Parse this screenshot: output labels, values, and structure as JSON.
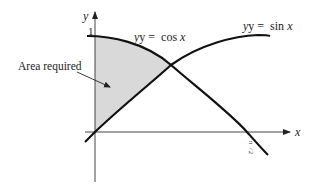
{
  "diagram": {
    "type": "area-between-curves",
    "axes": {
      "x_label": "x",
      "y_label": "y",
      "y_tick_label": "1",
      "x_tick_label_num": "π",
      "x_tick_label_den": "2"
    },
    "curves": [
      {
        "name": "cos",
        "label_prefix": "y = ",
        "label_func": "cos",
        "label_var": "x"
      },
      {
        "name": "sin",
        "label_prefix": "y = ",
        "label_func": "sin",
        "label_var": "x"
      }
    ],
    "annotation": {
      "text": "Area required"
    },
    "colors": {
      "curve": "#111111",
      "axis": "#444444",
      "shade": "#d9d9d9",
      "text": "#222222"
    }
  }
}
